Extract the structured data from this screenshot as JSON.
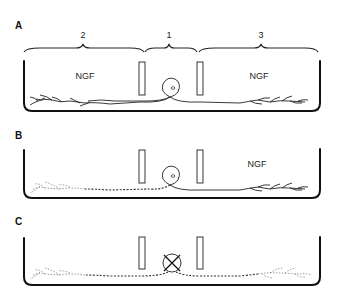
{
  "figure": {
    "panels": [
      {
        "label": "A",
        "regions": {
          "left": "2",
          "center": "1",
          "right": "3"
        },
        "left_text": "NGF",
        "right_text": "NGF",
        "description": "Neuron in center compartment 1 with axons extending into both side compartments 2 and 3, both containing NGF"
      },
      {
        "label": "B",
        "left_text": "",
        "right_text": "NGF",
        "description": "NGF removed from compartment 2; axons there degenerate (dashed), axons in compartment 3 with NGF survive"
      },
      {
        "label": "C",
        "left_text": "",
        "right_text": "",
        "description": "NGF absent from all compartments; cell body dies (crossed circle) and all axons degenerate (dashed)"
      }
    ]
  }
}
